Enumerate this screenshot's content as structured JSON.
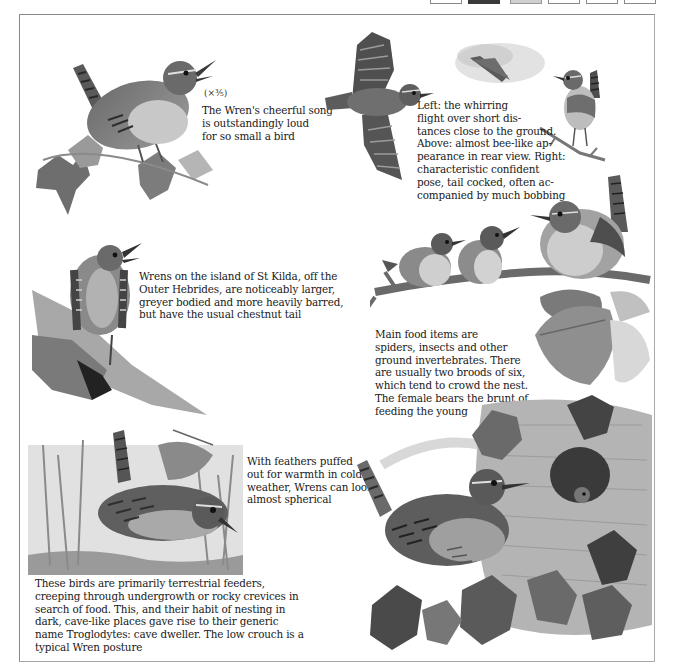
{
  "page": {
    "edge_tabs": [
      {
        "style": "white"
      },
      {
        "style": "dark"
      },
      {
        "style": "grey"
      },
      {
        "style": "white"
      },
      {
        "style": "white"
      },
      {
        "style": "white"
      }
    ]
  },
  "captions": {
    "song": {
      "scale": "(×⅗)",
      "lines": [
        "The Wren's cheerful song",
        "is outstandingly loud",
        "for so small a bird"
      ]
    },
    "flight": {
      "lines": [
        "Left: the whirring",
        "flight over short dis-",
        "tances close to the ground.",
        "Above: almost bee-like ap-",
        "pearance in rear view. Right:",
        "characteristic confident",
        "pose, tail cocked, often ac-",
        "companied by much bobbing"
      ]
    },
    "st_kilda": {
      "lines": [
        "Wrens on the island of St Kilda, off the",
        "Outer Hebrides, are noticeably larger,",
        "greyer bodied and more heavily barred,",
        "but have the usual chestnut tail"
      ]
    },
    "food": {
      "lines": [
        "Main food items are",
        "spiders, insects and other",
        "ground invertebrates. There",
        "are usually two broods of six,",
        "which tend to crowd the nest.",
        "The female bears the brunt of",
        "feeding the young"
      ]
    },
    "feathers": {
      "lines": [
        "With feathers puffed",
        "out for warmth in cold",
        "weather, Wrens can look",
        "almost spherical"
      ]
    },
    "terrestrial": {
      "lines": [
        "These birds are primarily terrestrial feeders,",
        "creeping through undergrowth or rocky crevices in",
        "search of food. This, and their habit of nesting in",
        "dark, cave-like places gave rise to their generic",
        "name Troglodytes: cave dweller. The low crouch is a",
        "typical Wren posture"
      ]
    }
  },
  "illustrations": [
    {
      "id": "singing-wren",
      "subject": "Wren singing on ivy"
    },
    {
      "id": "flying-wren",
      "subject": "Wren in flight, wings spread"
    },
    {
      "id": "rear-view-wren",
      "subject": "Wren in flight, rear view"
    },
    {
      "id": "perched-wren-small",
      "subject": "Wren perched on twig, tail cocked"
    },
    {
      "id": "st-kilda-wren",
      "subject": "St Kilda Wren on rock"
    },
    {
      "id": "wren-family",
      "subject": "Adult wren and two young on branch"
    },
    {
      "id": "crouching-wren",
      "subject": "Wren creeping through undergrowth"
    },
    {
      "id": "nest-wren",
      "subject": "Wren at nest among ivy"
    }
  ],
  "colors": {
    "ink": "#202020",
    "frame": "#8a8a8a",
    "paper": "#ffffff"
  }
}
